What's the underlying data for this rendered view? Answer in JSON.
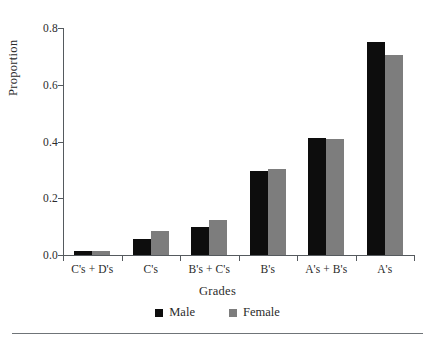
{
  "chart_data": {
    "type": "bar",
    "title": "",
    "xlabel": "Grades",
    "ylabel": "Proportion",
    "categories": [
      "C's + D's",
      "C's",
      "B's + C's",
      "B's",
      "A's + B's",
      "A's"
    ],
    "series": [
      {
        "name": "Male",
        "color": "#0d0d0d",
        "values": [
          0.015,
          0.055,
          0.1,
          0.296,
          0.412,
          0.75
        ]
      },
      {
        "name": "Female",
        "color": "#7d7d7d",
        "values": [
          0.015,
          0.085,
          0.125,
          0.303,
          0.408,
          0.705
        ]
      }
    ],
    "ylim": [
      0.0,
      0.8
    ],
    "yticks": [
      "0.0",
      "0.2",
      "0.4",
      "0.6",
      "0.8"
    ],
    "ytick_values": [
      0.0,
      0.2,
      0.4,
      0.6,
      0.8
    ],
    "grid": false,
    "legend_position": "bottom-center"
  }
}
